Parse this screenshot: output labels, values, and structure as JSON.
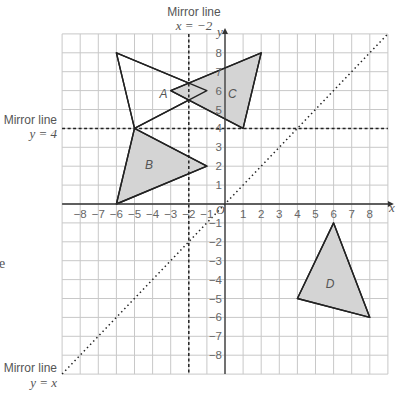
{
  "diagram": {
    "grid": {
      "x_min": -9,
      "x_max": 9,
      "y_min": -9,
      "y_max": 9,
      "origin_px": [
        225,
        204
      ],
      "unit_x_px": 18.1,
      "unit_y_px": 18.9,
      "line_color": "#c8c8c8",
      "axis_color": "#333333"
    },
    "axes": {
      "x_label": "x",
      "y_label": "y",
      "origin_label": "O",
      "x_ticks": [
        "-8",
        "-7",
        "-6",
        "-5",
        "-4",
        "-3",
        "-2",
        "-1",
        "1",
        "2",
        "3",
        "4",
        "5",
        "6",
        "7",
        "8"
      ],
      "y_ticks": [
        "8",
        "7",
        "6",
        "5",
        "4",
        "3",
        "2",
        "1",
        "-1",
        "-2",
        "-3",
        "-4",
        "-5",
        "-6",
        "-7",
        "-8"
      ]
    },
    "mirror_lines": [
      {
        "name": "x = -2",
        "title": "Mirror line",
        "equation": "x = −2"
      },
      {
        "name": "y = 4",
        "title": "Mirror line",
        "equation": "y = 4"
      },
      {
        "name": "y = x",
        "title": "Mirror line",
        "equation": "y = x"
      }
    ],
    "shapes": [
      {
        "label": "A",
        "vertices": [
          [
            -6,
            8
          ],
          [
            -5,
            4
          ],
          [
            -1,
            6
          ]
        ],
        "fill": "#ffffff"
      },
      {
        "label": "B",
        "vertices": [
          [
            -5,
            4
          ],
          [
            -6,
            0
          ],
          [
            -1,
            2
          ]
        ],
        "fill": "#d4d4d4"
      },
      {
        "label": "C",
        "vertices": [
          [
            2,
            8
          ],
          [
            1,
            4
          ],
          [
            -3,
            6
          ]
        ],
        "fill": "#d4d4d4"
      },
      {
        "label": "D",
        "vertices": [
          [
            6,
            -1
          ],
          [
            4,
            -5
          ],
          [
            8,
            -6
          ]
        ],
        "fill": "#d4d4d4"
      }
    ],
    "fragment_text": "e"
  }
}
